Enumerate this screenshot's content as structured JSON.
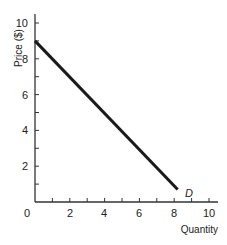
{
  "chart_data": {
    "type": "line",
    "title": "",
    "xlabel": "Quantity",
    "ylabel": "Price ($)",
    "xlim": [
      0,
      10
    ],
    "ylim": [
      0,
      10
    ],
    "grid": false,
    "x_ticks": [
      0,
      2,
      4,
      6,
      8,
      10
    ],
    "y_ticks": [
      2,
      4,
      6,
      8,
      10
    ],
    "x_minor_ticks": [
      1,
      2,
      3,
      4,
      5,
      6,
      7,
      8,
      9,
      10
    ],
    "y_minor_ticks": [
      1,
      2,
      3,
      4,
      5,
      6,
      7,
      8,
      9,
      10
    ],
    "series": [
      {
        "name": "D",
        "label": "D",
        "x": [
          0,
          8.2
        ],
        "y": [
          9,
          0.7
        ],
        "color": "#1a1a1a"
      }
    ],
    "annotations": [
      {
        "text": "D",
        "x": 8.6,
        "y": 0.5
      }
    ]
  },
  "labels": {
    "origin": "0",
    "xlabel": "Quantity",
    "ylabel": "Price ($)",
    "curve": "D",
    "x_ticks": [
      "2",
      "4",
      "6",
      "8",
      "10"
    ],
    "y_ticks": [
      "2",
      "4",
      "6",
      "8",
      "10"
    ]
  }
}
